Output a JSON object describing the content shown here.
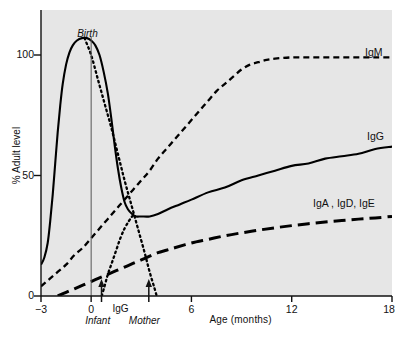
{
  "chart_data": {
    "type": "line",
    "title": "",
    "xlabel": "Age (months)",
    "ylabel": "% Adult level",
    "xlim": [
      -3,
      18
    ],
    "ylim": [
      0,
      112
    ],
    "grid": false,
    "legend_position": "right-inline",
    "xticks": [
      -3,
      0,
      6,
      12,
      18
    ],
    "xticklabels": [
      "−3",
      "0",
      "6",
      "12",
      "18"
    ],
    "yticks": [
      0,
      50,
      100
    ],
    "yticklabels": [
      "0",
      "50",
      "100"
    ],
    "annotations": [
      {
        "text": "Birth",
        "x": 0,
        "y": 112,
        "style": "italic"
      },
      {
        "text": "Infant",
        "x": 0.6,
        "y": -10,
        "style": "italic"
      },
      {
        "text": "Mother",
        "x": 3.5,
        "y": -10,
        "style": "italic"
      },
      {
        "text": "IgG",
        "x": 2.0,
        "y": -4,
        "style": "plain"
      }
    ],
    "series": [
      {
        "name": "IgG",
        "label": "IgG",
        "linestyle": "solid",
        "color": "#000000",
        "points": [
          [
            -3.0,
            13
          ],
          [
            -2.8,
            16
          ],
          [
            -2.6,
            22
          ],
          [
            -2.45,
            31
          ],
          [
            -2.3,
            42
          ],
          [
            -2.15,
            55
          ],
          [
            -2.0,
            68
          ],
          [
            -1.85,
            79
          ],
          [
            -1.7,
            88
          ],
          [
            -1.5,
            96
          ],
          [
            -1.3,
            101
          ],
          [
            -1.1,
            104
          ],
          [
            -0.85,
            106
          ],
          [
            -0.55,
            107
          ],
          [
            -0.25,
            107
          ],
          [
            0.0,
            106
          ],
          [
            0.25,
            104
          ],
          [
            0.5,
            100
          ],
          [
            0.75,
            93
          ],
          [
            1.0,
            84
          ],
          [
            1.2,
            74
          ],
          [
            1.4,
            63
          ],
          [
            1.6,
            53
          ],
          [
            1.8,
            45
          ],
          [
            2.0,
            39
          ],
          [
            2.2,
            36
          ],
          [
            2.45,
            34
          ],
          [
            2.7,
            33
          ],
          [
            3.0,
            33
          ],
          [
            3.5,
            33
          ],
          [
            4.0,
            34
          ],
          [
            4.6,
            36
          ],
          [
            5.3,
            38
          ],
          [
            6.0,
            40
          ],
          [
            7.0,
            43
          ],
          [
            8.0,
            45
          ],
          [
            9.0,
            48
          ],
          [
            10.0,
            50
          ],
          [
            11.0,
            52
          ],
          [
            12.0,
            54
          ],
          [
            13.0,
            55
          ],
          [
            14.0,
            57
          ],
          [
            15.0,
            58
          ],
          [
            16.0,
            59
          ],
          [
            17.0,
            61
          ],
          [
            18.0,
            62
          ]
        ]
      },
      {
        "name": "IgM",
        "label": "IgM",
        "linestyle": "dashed-short",
        "color": "#000000",
        "points": [
          [
            -3.0,
            4
          ],
          [
            -2.5,
            7
          ],
          [
            -2.0,
            10
          ],
          [
            -1.5,
            13
          ],
          [
            -1.0,
            17
          ],
          [
            -0.5,
            20
          ],
          [
            0.0,
            24
          ],
          [
            0.5,
            28
          ],
          [
            1.0,
            32
          ],
          [
            1.5,
            36
          ],
          [
            2.0,
            40
          ],
          [
            2.5,
            44
          ],
          [
            3.0,
            48
          ],
          [
            3.5,
            52
          ],
          [
            4.0,
            57
          ],
          [
            4.5,
            61
          ],
          [
            5.0,
            65
          ],
          [
            5.5,
            69
          ],
          [
            6.0,
            73
          ],
          [
            6.5,
            77
          ],
          [
            7.0,
            81
          ],
          [
            7.5,
            85
          ],
          [
            8.0,
            88
          ],
          [
            8.5,
            91
          ],
          [
            9.0,
            94
          ],
          [
            9.5,
            96
          ],
          [
            10.0,
            97
          ],
          [
            10.5,
            98
          ],
          [
            11.0,
            98.5
          ],
          [
            12.0,
            99
          ],
          [
            13.0,
            99
          ],
          [
            14.0,
            99
          ],
          [
            15.0,
            99
          ],
          [
            16.0,
            99
          ],
          [
            17.0,
            99
          ],
          [
            18.0,
            99
          ]
        ]
      },
      {
        "name": "IgA, IgD, IgE",
        "label": "IgA , IgD, IgE",
        "linestyle": "dashed-long",
        "color": "#000000",
        "points": [
          [
            -2.0,
            0
          ],
          [
            -1.5,
            1.5
          ],
          [
            -1.0,
            3
          ],
          [
            -0.5,
            4.5
          ],
          [
            0.0,
            6
          ],
          [
            0.5,
            7.5
          ],
          [
            1.0,
            9
          ],
          [
            1.5,
            10.5
          ],
          [
            2.0,
            12
          ],
          [
            2.5,
            13.5
          ],
          [
            3.0,
            15
          ],
          [
            3.5,
            16.5
          ],
          [
            4.0,
            18
          ],
          [
            4.5,
            19
          ],
          [
            5.0,
            20
          ],
          [
            6.0,
            22
          ],
          [
            7.0,
            23.5
          ],
          [
            8.0,
            25
          ],
          [
            9.0,
            26.2
          ],
          [
            10.0,
            27.3
          ],
          [
            11.0,
            28.3
          ],
          [
            12.0,
            29.2
          ],
          [
            13.0,
            30
          ],
          [
            14.0,
            30.7
          ],
          [
            15.0,
            31.3
          ],
          [
            16.0,
            31.9
          ],
          [
            17.0,
            32.4
          ],
          [
            18.0,
            33
          ]
        ]
      },
      {
        "name": "Maternal IgG",
        "label": "",
        "linestyle": "dotted",
        "color": "#000000",
        "points": [
          [
            -0.4,
            107
          ],
          [
            0.0,
            100
          ],
          [
            0.4,
            90
          ],
          [
            0.8,
            80
          ],
          [
            1.2,
            70
          ],
          [
            1.6,
            59
          ],
          [
            2.0,
            48
          ],
          [
            2.4,
            38
          ],
          [
            2.8,
            28
          ],
          [
            3.2,
            18
          ],
          [
            3.5,
            10
          ],
          [
            3.8,
            3
          ],
          [
            4.0,
            -2
          ]
        ]
      },
      {
        "name": "Infant IgG",
        "label": "",
        "linestyle": "dotted",
        "color": "#000000",
        "points": [
          [
            0.55,
            -2
          ],
          [
            0.8,
            4
          ],
          [
            1.0,
            9
          ],
          [
            1.25,
            14
          ],
          [
            1.5,
            19
          ],
          [
            1.75,
            24
          ],
          [
            2.0,
            28
          ],
          [
            2.25,
            31
          ],
          [
            2.45,
            33
          ],
          [
            2.6,
            34
          ]
        ]
      }
    ]
  }
}
